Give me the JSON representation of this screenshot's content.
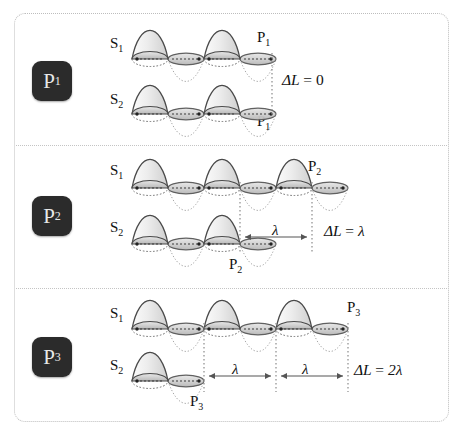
{
  "figure": {
    "colors": {
      "frame": "#bdbdbd",
      "badge_bg": "#2b2b2b",
      "badge_text": "#e8e8e8",
      "wave_outline": "#4a4a4a",
      "wave_fill_light": "#f2f2f2",
      "wave_fill_dark": "#c9c9c9",
      "trough_line": "#9a9a9a",
      "guide_line": "#808080",
      "text": "#111111"
    }
  },
  "panels": [
    {
      "badge": "P",
      "badge_sub": "1",
      "source_top": "S",
      "source_top_sub": "1",
      "source_bottom": "S",
      "source_bottom_sub": "2",
      "point_top": "P",
      "point_top_sub": "1",
      "point_bottom": "P",
      "point_bottom_sub": "1",
      "delta_label": "ΔL",
      "delta_eq": "=",
      "delta_value": "0",
      "lambda_marks": [],
      "crests_top": 2,
      "crests_bottom": 2
    },
    {
      "badge": "P",
      "badge_sub": "2",
      "source_top": "S",
      "source_top_sub": "1",
      "source_bottom": "S",
      "source_bottom_sub": "2",
      "point_top": "P",
      "point_top_sub": "2",
      "point_bottom": "P",
      "point_bottom_sub": "2",
      "delta_label": "ΔL",
      "delta_eq": "=",
      "delta_value": "λ",
      "lambda_marks": [
        "λ"
      ],
      "crests_top": 3,
      "crests_bottom": 2
    },
    {
      "badge": "P",
      "badge_sub": "3",
      "source_top": "S",
      "source_top_sub": "1",
      "source_bottom": "S",
      "source_bottom_sub": "2",
      "point_top": "P",
      "point_top_sub": "3",
      "point_bottom": "P",
      "point_bottom_sub": "3",
      "delta_label": "ΔL",
      "delta_eq": "=",
      "delta_value": "2λ",
      "lambda_marks": [
        "λ",
        "λ"
      ],
      "crests_top": 3,
      "crests_bottom": 1
    }
  ]
}
